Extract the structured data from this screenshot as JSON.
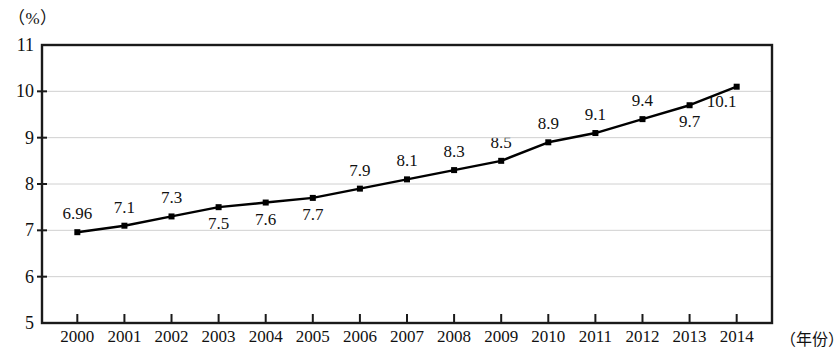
{
  "chart_data": {
    "type": "line",
    "title": "",
    "subtitle": "",
    "xlabel": "（年份）",
    "ylabel": "（%）",
    "ylim": [
      5,
      11
    ],
    "yticks": [
      5,
      6,
      7,
      8,
      9,
      10,
      11
    ],
    "ytick_labels": [
      "5",
      "6",
      "7",
      "8",
      "9",
      "10",
      "11"
    ],
    "grid": true,
    "grid_axis": "y",
    "legend": null,
    "legend_position": "none",
    "marker": "square",
    "line_color": "#000000",
    "marker_color": "#000000",
    "grid_color": "#d0d0d0",
    "axis_color": "#1a1a1a",
    "background_color": "#ffffff",
    "categories": [
      "2000",
      "2001",
      "2002",
      "2003",
      "2004",
      "2005",
      "2006",
      "2007",
      "2008",
      "2009",
      "2010",
      "2011",
      "2012",
      "2013",
      "2014"
    ],
    "x": [
      2000,
      2001,
      2002,
      2003,
      2004,
      2005,
      2006,
      2007,
      2008,
      2009,
      2010,
      2011,
      2012,
      2013,
      2014
    ],
    "values": [
      6.96,
      7.1,
      7.3,
      7.5,
      7.6,
      7.7,
      7.9,
      8.1,
      8.3,
      8.5,
      8.9,
      9.1,
      9.4,
      9.7,
      10.1
    ],
    "data_labels": [
      "6.96",
      "7.1",
      "7.3",
      "7.5",
      "7.6",
      "7.7",
      "7.9",
      "8.1",
      "8.3",
      "8.5",
      "8.9",
      "9.1",
      "9.4",
      "9.7",
      "10.1"
    ],
    "data_label_positions": [
      "above",
      "above",
      "above",
      "below",
      "below",
      "below",
      "above",
      "above",
      "above",
      "above",
      "above",
      "above",
      "above",
      "below",
      "below-left"
    ],
    "series": [
      {
        "name": "",
        "values": [
          6.96,
          7.1,
          7.3,
          7.5,
          7.6,
          7.7,
          7.9,
          8.1,
          8.3,
          8.5,
          8.9,
          9.1,
          9.4,
          9.7,
          10.1
        ]
      }
    ]
  }
}
